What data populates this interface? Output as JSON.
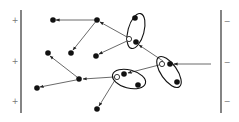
{
  "diagram": {
    "title": "",
    "left_plate": {
      "x": 21,
      "y1": 10,
      "y2": 113,
      "signs": [
        {
          "label": "+",
          "x": 15,
          "y": 20
        },
        {
          "label": "+",
          "x": 15,
          "y": 61
        },
        {
          "label": "+",
          "x": 15,
          "y": 101
        }
      ]
    },
    "right_plate": {
      "x": 221,
      "y1": 10,
      "y2": 113,
      "signs": [
        {
          "label": "−",
          "x": 227,
          "y": 21
        },
        {
          "label": "−",
          "x": 227,
          "y": 62
        },
        {
          "label": "−",
          "x": 227,
          "y": 101
        }
      ]
    },
    "nodes": [
      {
        "id": "n1",
        "x": 53,
        "y": 20,
        "type": "filled"
      },
      {
        "id": "n2",
        "x": 97,
        "y": 20,
        "type": "filled"
      },
      {
        "id": "n3",
        "x": 71,
        "y": 53,
        "type": "filled"
      },
      {
        "id": "n4",
        "x": 48,
        "y": 53,
        "type": "filled"
      },
      {
        "id": "n5",
        "x": 96,
        "y": 56,
        "type": "filled"
      },
      {
        "id": "n6",
        "x": 135,
        "y": 18,
        "type": "filled"
      },
      {
        "id": "n7",
        "x": 129,
        "y": 39,
        "type": "hollow"
      },
      {
        "id": "n8",
        "x": 136,
        "y": 42,
        "type": "filled"
      },
      {
        "id": "n9",
        "x": 162,
        "y": 64,
        "type": "hollow"
      },
      {
        "id": "n10",
        "x": 170,
        "y": 64,
        "type": "filled"
      },
      {
        "id": "n11",
        "x": 177,
        "y": 82,
        "type": "filled"
      },
      {
        "id": "n12",
        "x": 117,
        "y": 77,
        "type": "hollow"
      },
      {
        "id": "n13",
        "x": 124,
        "y": 74,
        "type": "filled"
      },
      {
        "id": "n14",
        "x": 138,
        "y": 85,
        "type": "filled"
      },
      {
        "id": "n15",
        "x": 79,
        "y": 79,
        "type": "filled"
      },
      {
        "id": "n16",
        "x": 37,
        "y": 88,
        "type": "filled"
      },
      {
        "id": "n17",
        "x": 97,
        "y": 109,
        "type": "filled"
      }
    ],
    "ellipses": [
      {
        "id": "e1",
        "cx": 136,
        "cy": 31,
        "rx": 8,
        "ry": 18,
        "rotate": 15
      },
      {
        "id": "e2",
        "cx": 169,
        "cy": 72,
        "rx": 8,
        "ry": 18,
        "rotate": -35
      },
      {
        "id": "e3",
        "cx": 129,
        "cy": 79,
        "rx": 17,
        "ry": 9,
        "rotate": 15
      }
    ],
    "arrows": [
      {
        "from": [
          97,
          20
        ],
        "to": [
          56,
          20
        ]
      },
      {
        "from": [
          97,
          20
        ],
        "to": [
          73,
          50
        ]
      },
      {
        "from": [
          127,
          37
        ],
        "to": [
          100,
          22
        ]
      },
      {
        "from": [
          127,
          41
        ],
        "to": [
          99,
          54
        ]
      },
      {
        "from": [
          163,
          61
        ],
        "to": [
          139,
          45
        ]
      },
      {
        "from": [
          211,
          64
        ],
        "to": [
          174,
          64
        ]
      },
      {
        "from": [
          159,
          65
        ],
        "to": [
          128,
          73
        ]
      },
      {
        "from": [
          114,
          77
        ],
        "to": [
          83,
          79
        ]
      },
      {
        "from": [
          77,
          77
        ],
        "to": [
          50,
          56
        ]
      },
      {
        "from": [
          76,
          80
        ],
        "to": [
          40,
          87
        ]
      },
      {
        "from": [
          115,
          80
        ],
        "to": [
          99,
          106
        ]
      }
    ]
  }
}
